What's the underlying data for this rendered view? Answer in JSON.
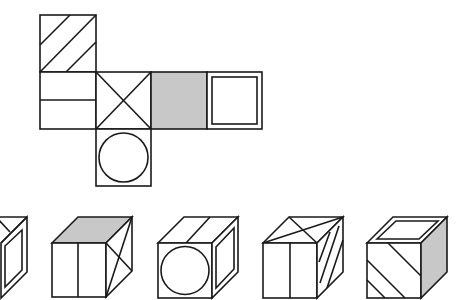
{
  "figure": {
    "type": "cube-net-puzzle",
    "net": {
      "faces": [
        {
          "id": "top",
          "pattern": "three-diagonal-stripes"
        },
        {
          "id": "left",
          "pattern": "horizontal-midline"
        },
        {
          "id": "center",
          "pattern": "x-cross"
        },
        {
          "id": "gray",
          "pattern": "solid-gray"
        },
        {
          "id": "right",
          "pattern": "inner-square"
        },
        {
          "id": "bottom",
          "pattern": "circle"
        }
      ]
    },
    "options": [
      {
        "id": "option-1",
        "front": "hidden",
        "top": "diagonal-lines",
        "right": "inner-square"
      },
      {
        "id": "option-2",
        "front": "vertical-midline",
        "top": "solid-gray",
        "right": "x-cross"
      },
      {
        "id": "option-3",
        "front": "circle",
        "top": "single-line",
        "right": "inner-square"
      },
      {
        "id": "option-4",
        "front": "vertical-midline",
        "top": "x-cross",
        "right": "diagonal-stripes"
      },
      {
        "id": "option-5",
        "front": "diagonal-stripes",
        "top": "inner-square",
        "right": "solid-gray"
      }
    ],
    "colors": {
      "stroke": "#1a1a1a",
      "gray_fill": "#c8c8c8",
      "background": "#ffffff"
    }
  }
}
